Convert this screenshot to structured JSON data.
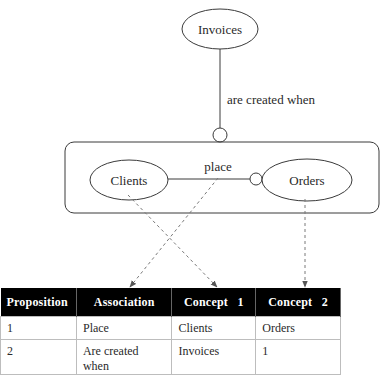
{
  "diagram": {
    "top_node": {
      "label": "Invoices"
    },
    "top_relation_label": "are created when",
    "group": {
      "left_node": {
        "label": "Clients"
      },
      "right_node": {
        "label": "Orders"
      },
      "relation_label": "place"
    }
  },
  "table": {
    "headers": [
      "Proposition",
      "Association",
      "Concept   1",
      "Concept   2"
    ],
    "rows": [
      [
        "1",
        "Place",
        "Clients",
        "Orders"
      ],
      [
        "2",
        "Are created when",
        "Invoices",
        "1"
      ]
    ]
  },
  "colors": {
    "line": "#3a3a3a",
    "dashed": "#7a7a7a",
    "header_bg": "#000000",
    "header_text": "#ffffff",
    "cell_border": "#bdbdbd"
  }
}
